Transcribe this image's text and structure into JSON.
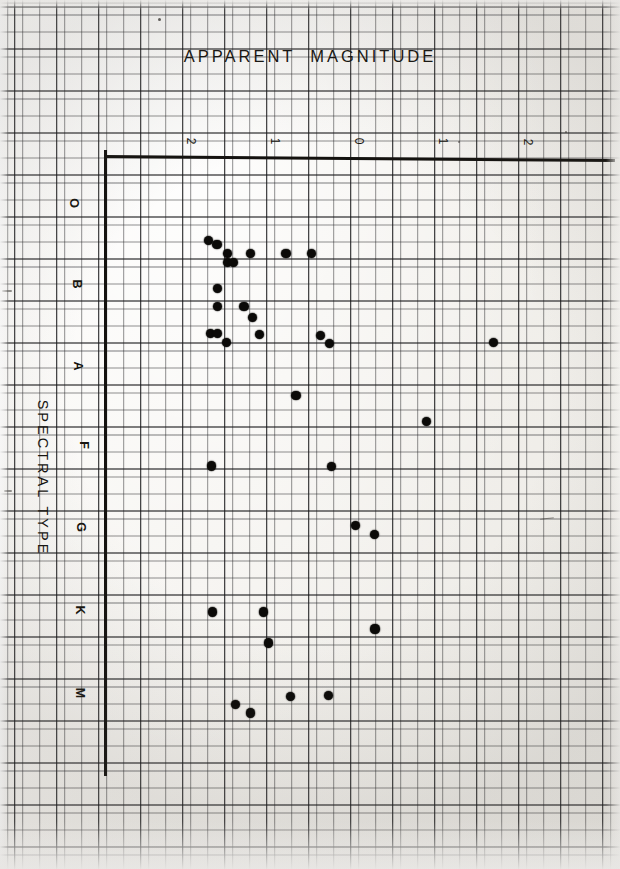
{
  "chart_data": {
    "type": "scatter",
    "title": "APPARENT  MAGNITUDE",
    "xlabel": "APPARENT MAGNITUDE",
    "ylabel": "SPECTRAL TYPE",
    "grid": true,
    "legend": "none",
    "xlim": [
      -2.5,
      3.0
    ],
    "ylim": [
      0,
      6.5
    ],
    "xticks": [
      -2,
      -1,
      0,
      1,
      2
    ],
    "xtick_labels": [
      "2",
      "1",
      "0",
      "1",
      "2"
    ],
    "yticks": [
      0,
      1,
      2,
      3,
      4,
      5,
      6
    ],
    "ytick_labels": [
      "O",
      "B",
      "A",
      "F",
      "G",
      "K",
      "M"
    ],
    "x": [
      -1.79,
      -1.69,
      -1.57,
      -1.57,
      -1.49,
      -1.29,
      -0.87,
      -0.57,
      -1.68,
      -1.68,
      -1.37,
      -1.77,
      -1.68,
      -1.58,
      -1.27,
      -1.18,
      -0.46,
      -0.35,
      1.6,
      -0.75,
      0.8,
      -1.76,
      -0.33,
      -0.04,
      0.18,
      -1.74,
      -1.14,
      0.19,
      -1.08,
      -0.82,
      -0.36,
      -1.47,
      -1.29
    ],
    "y": [
      0.47,
      0.52,
      0.63,
      0.74,
      0.74,
      0.63,
      0.63,
      0.63,
      1.06,
      1.28,
      1.28,
      1.61,
      1.61,
      1.72,
      1.42,
      1.63,
      1.64,
      1.74,
      1.72,
      2.37,
      2.69,
      3.24,
      3.25,
      3.97,
      4.08,
      5.03,
      5.03,
      5.24,
      5.41,
      6.07,
      6.06,
      6.17,
      6.27
    ],
    "point_count": 33,
    "point_color": "#0b0a08",
    "grid_color": "#28282a",
    "axis_color": "#14120f",
    "paper_color": "#f7f6f3"
  },
  "header": {
    "title": "APPARENT  MAGNITUDE"
  },
  "axes": {
    "y_axis_title": "SPECTRAL TYPE",
    "x_tick_labels": [
      "2",
      "1",
      "0",
      "1",
      "2"
    ],
    "y_tick_labels": [
      "O",
      "B",
      "A",
      "F",
      "G",
      "K",
      "M"
    ]
  }
}
